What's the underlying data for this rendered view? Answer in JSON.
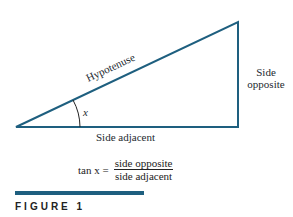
{
  "diagram": {
    "type": "right-triangle",
    "line_color": "#1e5f7f",
    "labels": {
      "hypotenuse": "Hypotenuse",
      "side_opposite_line1": "Side",
      "side_opposite_line2": "opposite",
      "side_adjacent": "Side adjacent",
      "angle": "x"
    },
    "formula": {
      "lhs": "tan x =",
      "numerator": "side opposite",
      "denominator": "side adjacent"
    }
  },
  "caption": {
    "label": "FIGURE 1"
  }
}
